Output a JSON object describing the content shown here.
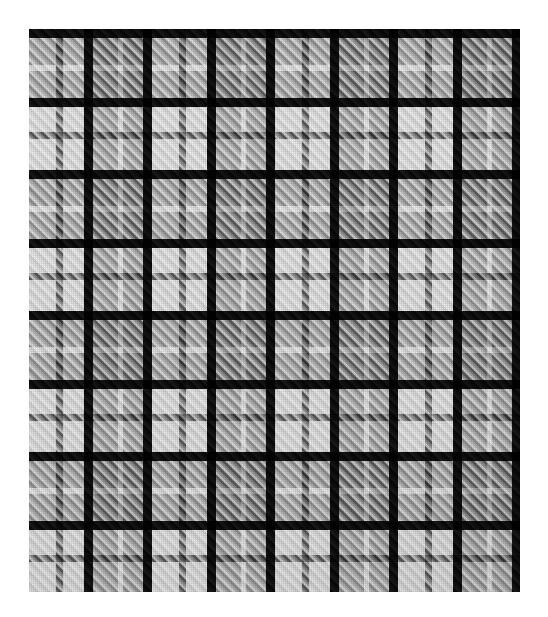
{
  "canvas": {
    "width": 548,
    "height": 617,
    "background_color": "#ffffff"
  },
  "swatch": {
    "name": "black-white-grey-tartan-plaid",
    "description": "Woven tartan / plaid textile swatch, black white and grey, 2-2 twill",
    "x": 29,
    "y": 29,
    "width": 491,
    "height": 563,
    "weave": "2/2 twill",
    "twill_direction": "right-hand",
    "twill_period_px": 8
  },
  "palette": {
    "white": "#f2f2f2",
    "bright_white": "#fafafa",
    "light_grey": "#c2c2c2",
    "mid_grey": "#9a9a9a",
    "grey": "#7e7e7e",
    "dark_grey": "#4d4d4d",
    "charcoal": "#3a3a3a",
    "black": "#101010",
    "deep_black": "#080808"
  },
  "sett": {
    "warp_repeat_px": 123,
    "weft_repeat_px": 141,
    "warp_origin_px": 29,
    "weft_origin_px": 29,
    "warp_threads": [
      {
        "color_key": "white",
        "hex": "#f2f2f2",
        "width": 27
      },
      {
        "color_key": "mid_grey",
        "hex": "#9a9a9a",
        "width": 7
      },
      {
        "color_key": "white",
        "hex": "#f2f2f2",
        "width": 21
      },
      {
        "color_key": "black",
        "hex": "#101010",
        "width": 9
      },
      {
        "color_key": "light_grey",
        "hex": "#c2c2c2",
        "width": 25
      },
      {
        "color_key": "white",
        "hex": "#f2f2f2",
        "width": 5
      },
      {
        "color_key": "light_grey",
        "hex": "#c2c2c2",
        "width": 20
      },
      {
        "color_key": "black",
        "hex": "#101010",
        "width": 9
      }
    ],
    "weft_threads": [
      {
        "color_key": "black",
        "hex": "#101010",
        "width": 9
      },
      {
        "color_key": "light_grey",
        "hex": "#c2c2c2",
        "width": 27
      },
      {
        "color_key": "white",
        "hex": "#f2f2f2",
        "width": 6
      },
      {
        "color_key": "light_grey",
        "hex": "#c2c2c2",
        "width": 27
      },
      {
        "color_key": "black",
        "hex": "#101010",
        "width": 9
      },
      {
        "color_key": "white",
        "hex": "#f2f2f2",
        "width": 25
      },
      {
        "color_key": "mid_grey",
        "hex": "#9a9a9a",
        "width": 7
      },
      {
        "color_key": "white",
        "hex": "#f2f2f2",
        "width": 31
      }
    ]
  },
  "chart_data": {
    "type": "heatmap",
    "xlabel": "warp thread band",
    "ylabel": "weft thread band",
    "x": [
      "white-27",
      "grey-7",
      "white-21",
      "black-9",
      "ltgrey-25",
      "white-5",
      "ltgrey-20",
      "black-9"
    ],
    "y": [
      "black-9",
      "ltgrey-27",
      "white-6",
      "ltgrey-27",
      "black-9",
      "white-25",
      "grey-7",
      "white-31"
    ],
    "grid": false,
    "legend": "none",
    "values": [
      [
        0.06,
        0.05,
        0.06,
        0.03,
        0.06,
        0.06,
        0.06,
        0.03
      ],
      [
        0.76,
        0.58,
        0.76,
        0.22,
        0.3,
        0.42,
        0.3,
        0.22
      ],
      [
        0.95,
        0.7,
        0.95,
        0.26,
        0.45,
        0.92,
        0.45,
        0.26
      ],
      [
        0.76,
        0.58,
        0.76,
        0.22,
        0.3,
        0.42,
        0.3,
        0.22
      ],
      [
        0.06,
        0.05,
        0.06,
        0.03,
        0.06,
        0.06,
        0.06,
        0.03
      ],
      [
        0.95,
        0.62,
        0.95,
        0.07,
        0.76,
        0.95,
        0.76,
        0.07
      ],
      [
        0.62,
        0.5,
        0.62,
        0.06,
        0.58,
        0.68,
        0.58,
        0.06
      ],
      [
        0.95,
        0.62,
        0.95,
        0.07,
        0.76,
        0.95,
        0.76,
        0.07
      ]
    ]
  }
}
